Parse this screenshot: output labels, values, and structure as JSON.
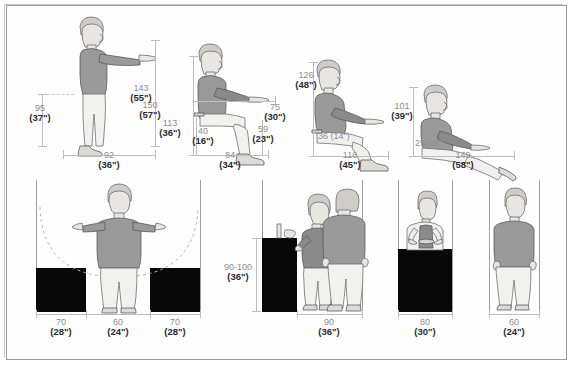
{
  "document": {
    "title": "Anthropometric and ergonomic clearance dimensions",
    "units_note": "Dimensions in centimetres with inches in parentheses"
  },
  "top_row": {
    "figures": [
      {
        "id": "standing-reach",
        "name": "standing-person-arm-forward",
        "dimensions": [
          {
            "name": "hip-height",
            "cm": "95",
            "inch": "(37\")"
          },
          {
            "name": "forward-reach-height",
            "cm": "150",
            "inch": "(57\")"
          },
          {
            "name": "standing-depth",
            "cm": "92",
            "inch": "(36\")"
          }
        ]
      },
      {
        "id": "seated-upright",
        "name": "seated-person-upright",
        "dimensions": [
          {
            "name": "seated-reach-height",
            "cm": "143",
            "inch": "(55\")"
          },
          {
            "name": "seated-eye-height",
            "cm": "113",
            "inch": "(36\")"
          },
          {
            "name": "seat-height",
            "cm": "40",
            "inch": "(16\")"
          },
          {
            "name": "seat-back-to-hand",
            "cm": "75",
            "inch": "(30\")"
          },
          {
            "name": "seat-front-clearance",
            "cm": "59",
            "inch": "(23\")"
          },
          {
            "name": "seated-depth",
            "cm": "84",
            "inch": "(34\")"
          }
        ]
      },
      {
        "id": "seated-reclined",
        "name": "seated-person-reclined",
        "dimensions": [
          {
            "name": "reclined-height",
            "cm": "126",
            "inch": "(48\")"
          },
          {
            "name": "reclined-seat-height",
            "cm": "36 (14\")",
            "inch": ""
          },
          {
            "name": "reclined-depth",
            "cm": "116",
            "inch": "(45\")"
          }
        ]
      },
      {
        "id": "lounging",
        "name": "lounging-person",
        "dimensions": [
          {
            "name": "lounge-height",
            "cm": "101",
            "inch": "(39\")"
          },
          {
            "name": "lounge-seat-height",
            "cm": "25(10\")",
            "inch": ""
          },
          {
            "name": "lounge-depth",
            "cm": "149",
            "inch": "(58\")"
          }
        ]
      }
    ]
  },
  "bottom_row": {
    "panels": [
      {
        "id": "reach-envelope",
        "name": "front-view-arms-outstretched",
        "dimensions": [
          {
            "name": "left-side-clearance",
            "cm": "70",
            "inch": "(28\")"
          },
          {
            "name": "body-width",
            "cm": "60",
            "inch": "(24\")"
          },
          {
            "name": "right-side-clearance",
            "cm": "70",
            "inch": "(28\")"
          }
        ]
      },
      {
        "id": "counter-and-passage",
        "name": "person-at-counter-with-passerby",
        "dimensions": [
          {
            "name": "counter-height",
            "cm": "90-100",
            "inch": "(36-40\")"
          },
          {
            "name": "passage-width",
            "cm": "90",
            "inch": "(36\")"
          }
        ]
      },
      {
        "id": "work-counter",
        "name": "person-behind-counter",
        "dimensions": [
          {
            "name": "work-station-width",
            "cm": "80",
            "inch": "(30\")"
          }
        ]
      },
      {
        "id": "single-standing",
        "name": "standing-person-front-view",
        "dimensions": [
          {
            "name": "minimum-width",
            "cm": "60",
            "inch": "(24\")"
          }
        ]
      }
    ]
  },
  "colors": {
    "frame": "#9a9a9a",
    "dimension_cm_text": "#8d8d8d",
    "dimension_inch_text": "#2b2b2b",
    "block_fill": "#080808",
    "shirt": "#9a9a9a",
    "pants": "#f3f1ee"
  }
}
